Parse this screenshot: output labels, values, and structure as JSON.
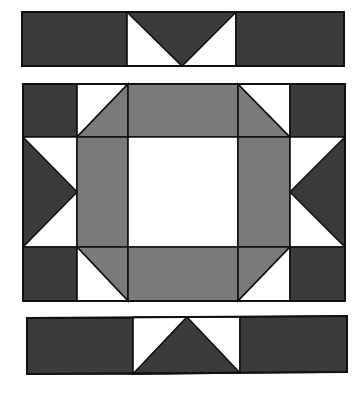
{
  "diagram": {
    "type": "quilt-block-assembly",
    "colors": {
      "dark": "#3b3b3b",
      "medium": "#7a7a7a",
      "light": "#ffffff",
      "outline": "#111111"
    },
    "pieces": [
      {
        "name": "top-strip-left-dark-rect",
        "group": "top-strip",
        "fill": "dark",
        "points": "22,12 127,12 127,66 22,66"
      },
      {
        "name": "top-strip-center-white-bg",
        "group": "top-strip",
        "fill": "light",
        "points": "127,12 236,12 236,66 127,66"
      },
      {
        "name": "top-strip-center-dark-triangle",
        "group": "top-strip",
        "fill": "dark",
        "points": "127,12 236,12 182,66"
      },
      {
        "name": "top-strip-right-dark-rect",
        "group": "top-strip",
        "fill": "dark",
        "points": "236,12 344,12 344,66 236,66"
      },
      {
        "name": "main-corner-top-left-dark",
        "group": "main-block",
        "fill": "dark",
        "points": "23,84 77,84 77,137 23,137"
      },
      {
        "name": "main-hst-top-left-white",
        "group": "main-block",
        "fill": "light",
        "points": "77,84 128,84 77,137"
      },
      {
        "name": "main-hst-top-left-gray",
        "group": "main-block",
        "fill": "medium",
        "points": "128,84 128,137 77,137"
      },
      {
        "name": "main-top-center-gray-rect",
        "group": "main-block",
        "fill": "medium",
        "points": "128,84 238,84 238,137 128,137"
      },
      {
        "name": "main-hst-top-right-gray",
        "group": "main-block",
        "fill": "medium",
        "points": "238,84 290,137 238,137"
      },
      {
        "name": "main-hst-top-right-white",
        "group": "main-block",
        "fill": "light",
        "points": "238,84 290,84 290,137"
      },
      {
        "name": "main-corner-top-right-dark",
        "group": "main-block",
        "fill": "dark",
        "points": "290,84 345,84 345,137 290,137"
      },
      {
        "name": "main-left-geese-white-bg",
        "group": "main-block",
        "fill": "light",
        "points": "23,137 77,137 77,247 23,247"
      },
      {
        "name": "main-left-geese-dark-triangle",
        "group": "main-block",
        "fill": "dark",
        "points": "23,137 77,192 23,247"
      },
      {
        "name": "main-left-center-gray-rect",
        "group": "main-block",
        "fill": "medium",
        "points": "77,137 128,137 128,247 77,247"
      },
      {
        "name": "main-center-white-square",
        "group": "main-block",
        "fill": "light",
        "points": "128,137 238,137 238,247 128,247"
      },
      {
        "name": "main-right-center-gray-rect",
        "group": "main-block",
        "fill": "medium",
        "points": "238,137 290,137 290,247 238,247"
      },
      {
        "name": "main-right-geese-white-bg",
        "group": "main-block",
        "fill": "light",
        "points": "290,137 345,137 345,247 290,247"
      },
      {
        "name": "main-right-geese-dark-triangle",
        "group": "main-block",
        "fill": "dark",
        "points": "345,137 290,192 345,247"
      },
      {
        "name": "main-corner-bottom-left-dark",
        "group": "main-block",
        "fill": "dark",
        "points": "23,247 77,247 77,301 23,301"
      },
      {
        "name": "main-hst-bottom-left-gray",
        "group": "main-block",
        "fill": "medium",
        "points": "77,247 128,247 128,301"
      },
      {
        "name": "main-hst-bottom-left-white",
        "group": "main-block",
        "fill": "light",
        "points": "77,247 128,301 77,301"
      },
      {
        "name": "main-bottom-center-gray-rect",
        "group": "main-block",
        "fill": "medium",
        "points": "128,247 238,247 238,301 128,301"
      },
      {
        "name": "main-hst-bottom-right-gray",
        "group": "main-block",
        "fill": "medium",
        "points": "238,247 290,247 238,301"
      },
      {
        "name": "main-hst-bottom-right-white",
        "group": "main-block",
        "fill": "light",
        "points": "290,247 290,301 238,301"
      },
      {
        "name": "main-corner-bottom-right-dark",
        "group": "main-block",
        "fill": "dark",
        "points": "290,247 345,247 345,301 290,301"
      },
      {
        "name": "bottom-strip-left-dark-rect",
        "group": "bottom-strip",
        "fill": "dark",
        "points": "27,318 133,318 133,374 27,374"
      },
      {
        "name": "bottom-strip-center-white-bg",
        "group": "bottom-strip",
        "fill": "light",
        "points": "133,317 240,317 240,373 133,374"
      },
      {
        "name": "bottom-strip-center-dark-triangle",
        "group": "bottom-strip",
        "fill": "dark",
        "points": "187,317 240,373 133,374"
      },
      {
        "name": "bottom-strip-right-dark-rect",
        "group": "bottom-strip",
        "fill": "dark",
        "points": "240,317 347,316 347,372 240,373"
      }
    ],
    "outlines": [
      {
        "name": "top-strip-outline",
        "points": "22,12 344,12 344,66 22,66"
      },
      {
        "name": "main-block-outline",
        "points": "23,84 345,84 345,301 23,301"
      },
      {
        "name": "bottom-strip-outline",
        "points": "27,318 347,316 347,372 27,374"
      }
    ]
  }
}
